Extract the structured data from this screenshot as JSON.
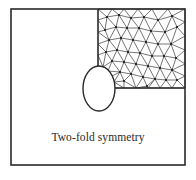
{
  "diagram": {
    "caption": "Two-fold symmetry",
    "colors": {
      "stroke": "#2a2a2a",
      "mesh": "#3a3a3a",
      "node": "#1a1a1a",
      "background": "#ffffff"
    },
    "components": [
      {
        "name": "plate-outline",
        "shape": "rectangle"
      },
      {
        "name": "elliptical-hole",
        "shape": "ellipse"
      },
      {
        "name": "mesh-region",
        "shape": "quadrant",
        "meshed": true,
        "element_type": "triangular"
      }
    ]
  }
}
